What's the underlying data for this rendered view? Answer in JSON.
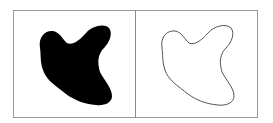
{
  "figure": {
    "panels": [
      {
        "name": "filled-shape",
        "style": "filled",
        "fill": "#000000"
      },
      {
        "name": "contour-shape",
        "style": "outline",
        "stroke": "#555555"
      }
    ],
    "colors": {
      "border": "#9a9a9a",
      "divider": "#8a8a8a",
      "background": "#ffffff"
    }
  }
}
